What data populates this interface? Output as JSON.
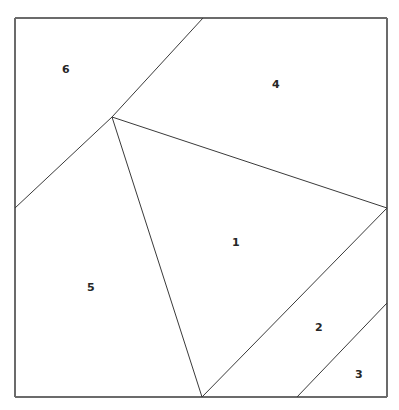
{
  "figure": {
    "name": "partitioned-square",
    "width": 399,
    "height": 410,
    "background_color": "#ffffff",
    "frame_color": "#6b6b6b",
    "line_color": "#3a3a3a",
    "label_color": "#262626"
  },
  "frame": {
    "left": 15,
    "top": 18,
    "right": 387,
    "bottom": 397
  },
  "vertices": {
    "top_left": {
      "x": 15,
      "y": 18
    },
    "top_right": {
      "x": 387,
      "y": 18
    },
    "bottom_left": {
      "x": 15,
      "y": 397
    },
    "bottom_right": {
      "x": 387,
      "y": 397
    },
    "junction": {
      "x": 112,
      "y": 117
    },
    "top_edge_point": {
      "x": 203,
      "y": 18
    },
    "left_edge_point": {
      "x": 15,
      "y": 208
    },
    "right_edge_point": {
      "x": 387,
      "y": 208
    },
    "bottom_edge_point": {
      "x": 202,
      "y": 397
    },
    "right_edge_lower": {
      "x": 387,
      "y": 303
    },
    "bottom_edge_right": {
      "x": 297,
      "y": 397
    }
  },
  "segments": [
    {
      "id": "seg-top-to-junction",
      "name": "divider-region6-region4-upper",
      "from": {
        "x": 203,
        "y": 18
      },
      "to": {
        "x": 112,
        "y": 117
      }
    },
    {
      "id": "seg-junction-to-left",
      "name": "divider-region6-region5",
      "from": {
        "x": 112,
        "y": 117
      },
      "to": {
        "x": 15,
        "y": 208
      }
    },
    {
      "id": "seg-junction-to-right",
      "name": "divider-region4-region1",
      "from": {
        "x": 112,
        "y": 117
      },
      "to": {
        "x": 387,
        "y": 208
      }
    },
    {
      "id": "seg-junction-to-bottom",
      "name": "divider-region5-region1",
      "from": {
        "x": 112,
        "y": 117
      },
      "to": {
        "x": 202,
        "y": 397
      }
    },
    {
      "id": "seg-right-to-bottom",
      "name": "divider-region1-region2",
      "from": {
        "x": 387,
        "y": 208
      },
      "to": {
        "x": 202,
        "y": 397
      }
    },
    {
      "id": "seg-rightlower-to-bottomright",
      "name": "divider-region2-region3",
      "from": {
        "x": 387,
        "y": 303
      },
      "to": {
        "x": 297,
        "y": 397
      }
    }
  ],
  "regions": [
    {
      "id": "region-1",
      "label": "1",
      "label_x": 236,
      "label_y": 243
    },
    {
      "id": "region-2",
      "label": "2",
      "label_x": 319,
      "label_y": 328
    },
    {
      "id": "region-3",
      "label": "3",
      "label_x": 359,
      "label_y": 375
    },
    {
      "id": "region-4",
      "label": "4",
      "label_x": 276,
      "label_y": 85
    },
    {
      "id": "region-5",
      "label": "5",
      "label_x": 91,
      "label_y": 288
    },
    {
      "id": "region-6",
      "label": "6",
      "label_x": 66,
      "label_y": 70
    }
  ]
}
